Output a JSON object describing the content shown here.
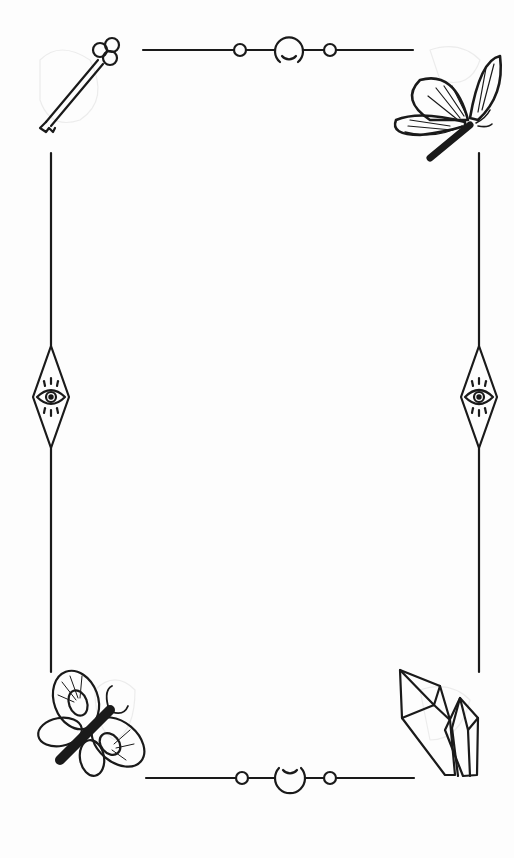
{
  "page": {
    "type": "decorative-frame",
    "content_area": {
      "text": ""
    }
  },
  "ornaments": {
    "top_left": "key-icon",
    "top_right": "butterfly-outline-icon",
    "bottom_left": "moth-filled-icon",
    "bottom_right": "crystal-cluster-icon",
    "left_middle": "eye-diamond-icon",
    "right_middle": "eye-diamond-icon",
    "top_center": "crescent-moon-icon",
    "bottom_center": "crescent-moon-icon"
  },
  "colors": {
    "background": "#fdfdfd",
    "ink": "#1a1a1a",
    "faint": "#ececec"
  }
}
